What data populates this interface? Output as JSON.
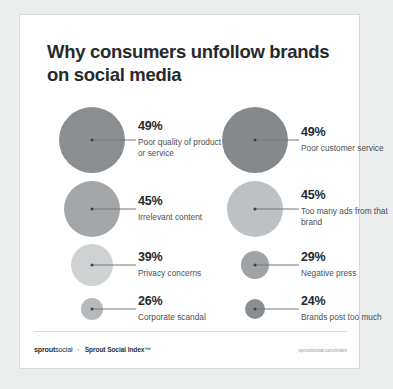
{
  "card": {
    "title": "Why consumers unfollow brands on social media"
  },
  "footer": {
    "brand_bold": "sprout",
    "brand_light": "social",
    "separator": "·",
    "index_label": "Sprout Social Index™",
    "url": "sproutsocial.com/index"
  },
  "chart_data": {
    "type": "bubble",
    "title": "Why consumers unfollow brands on social media",
    "xlabel": "",
    "ylabel": "",
    "unit": "percent",
    "columns": [
      "left",
      "right"
    ],
    "categories": [
      "Poor quality of product or service",
      "Poor customer service",
      "Irrelevant content",
      "Too many ads from that brand",
      "Privacy concerns",
      "Negative press",
      "Corporate scandal",
      "Brands post too much"
    ],
    "values": [
      49,
      49,
      45,
      45,
      39,
      29,
      26,
      24
    ],
    "points": [
      {
        "label": "Poor quality of product or service",
        "percent_text": "49%",
        "value": 49,
        "column": "left",
        "color": "#8b8f91",
        "cx": 72,
        "cy": 125,
        "r": 33,
        "line_x": 72,
        "line_w": 44,
        "label_x": 118
      },
      {
        "label": "Poor customer service",
        "percent_text": "49%",
        "value": 49,
        "column": "right",
        "color": "#85898b",
        "cx": 235,
        "cy": 125,
        "r": 33,
        "line_x": 235,
        "line_w": 44,
        "label_x": 281
      },
      {
        "label": "Irrelevant content",
        "percent_text": "45%",
        "value": 45,
        "column": "left",
        "color": "#a3a7a9",
        "cx": 72,
        "cy": 194,
        "r": 28,
        "line_x": 72,
        "line_w": 44,
        "label_x": 118
      },
      {
        "label": "Too many ads from that brand",
        "percent_text": "45%",
        "value": 45,
        "column": "right",
        "color": "#bdc1c3",
        "cx": 235,
        "cy": 194,
        "r": 28,
        "line_x": 235,
        "line_w": 44,
        "label_x": 281
      },
      {
        "label": "Privacy concerns",
        "percent_text": "39%",
        "value": 39,
        "column": "left",
        "color": "#cfd2d3",
        "cx": 72,
        "cy": 250,
        "r": 21,
        "line_x": 72,
        "line_w": 44,
        "label_x": 118
      },
      {
        "label": "Negative press",
        "percent_text": "29%",
        "value": 29,
        "column": "right",
        "color": "#9fa3a5",
        "cx": 235,
        "cy": 250,
        "r": 14,
        "line_x": 235,
        "line_w": 44,
        "label_x": 281
      },
      {
        "label": "Corporate scandal",
        "percent_text": "26%",
        "value": 26,
        "column": "left",
        "color": "#b6babc",
        "cx": 72,
        "cy": 294,
        "r": 11,
        "line_x": 72,
        "line_w": 44,
        "label_x": 118
      },
      {
        "label": "Brands post too much",
        "percent_text": "24%",
        "value": 24,
        "column": "right",
        "color": "#8a8e90",
        "cx": 235,
        "cy": 294,
        "r": 10,
        "line_x": 235,
        "line_w": 44,
        "label_x": 281
      }
    ]
  }
}
